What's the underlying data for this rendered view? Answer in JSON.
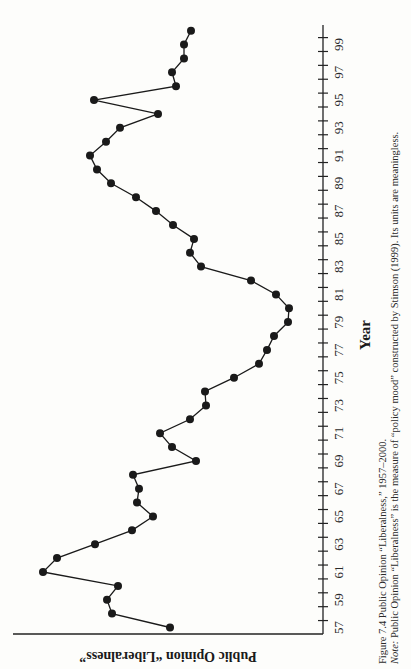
{
  "figure": {
    "caption": "Figure 7.4 Public Opinion “Liberalness,” 1957–2000.",
    "note_label": "Note:",
    "note_text": " Public Opinion “Liberalness” is the measure of “policy mood” constructed by Stimson (1999). Its units are meaningless."
  },
  "chart_data": {
    "type": "line",
    "title": "Public Opinion “Liberalness,” 1957–2000",
    "xlabel": "Year",
    "ylabel": "Public Opinion “Liberalness”",
    "orientation_note": "Figure printed rotated 90° on the page: Year axis runs vertically (57 at bottom, 2000 at top), liberalness increases to the left.",
    "x_tick_labels": [
      "57",
      "59",
      "61",
      "63",
      "65",
      "67",
      "69",
      "71",
      "73",
      "75",
      "77",
      "79",
      "81",
      "83",
      "85",
      "87",
      "89",
      "91",
      "93",
      "95",
      "97",
      "99"
    ],
    "x": [
      1957,
      1958,
      1959,
      1960,
      1961,
      1962,
      1963,
      1964,
      1965,
      1966,
      1967,
      1968,
      1969,
      1970,
      1971,
      1972,
      1973,
      1974,
      1975,
      1976,
      1977,
      1978,
      1979,
      1980,
      1981,
      1982,
      1983,
      1984,
      1985,
      1986,
      1987,
      1988,
      1989,
      1990,
      1991,
      1992,
      1993,
      1994,
      1995,
      1996,
      1997,
      1998,
      1999,
      2000
    ],
    "series": [
      {
        "name": "Policy mood (liberalness, arbitrary units)",
        "values": [
          152,
          210,
          215,
          204,
          279,
          265,
          227,
          190,
          169,
          185,
          183,
          189,
          126,
          150,
          162,
          132,
          116,
          117,
          88,
          63,
          55,
          48,
          34,
          33,
          46,
          71,
          121,
          132,
          128,
          149,
          166,
          186,
          211,
          225,
          232,
          216,
          202,
          164,
          228,
          146,
          150,
          138,
          138,
          131
        ]
      }
    ],
    "ylim": [
      0,
      310
    ],
    "y_tick_labels": [],
    "grid": false,
    "legend": "none",
    "markers": "filled circles",
    "line_color": "#1a1a1a"
  }
}
